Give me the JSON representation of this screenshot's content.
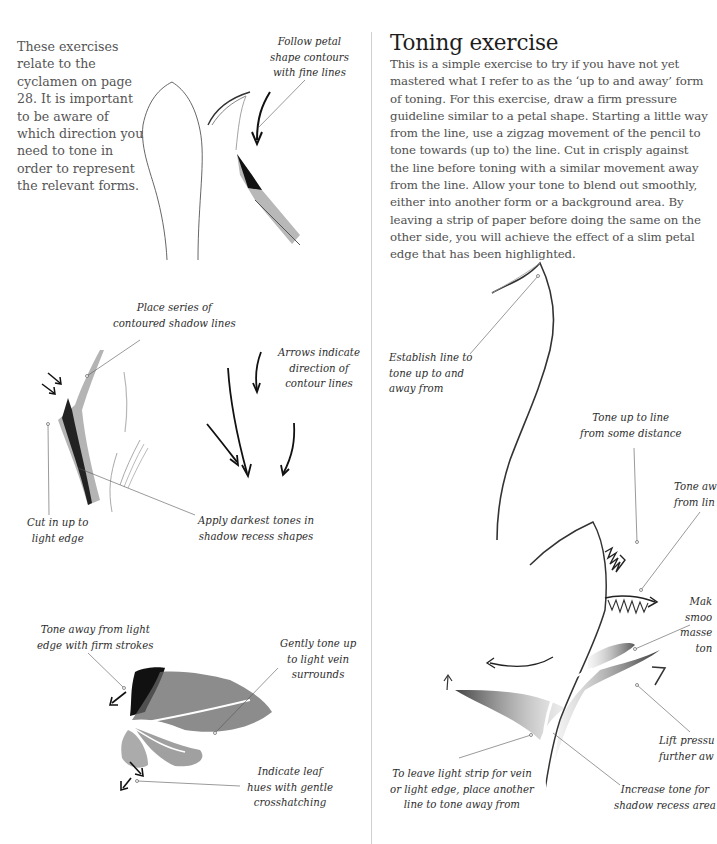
{
  "left_page": {
    "intro_text": "These exercises relate to the cyclamen on page 28. It is important to be aware of which direction you need to tone in order to represent the relevant forms.",
    "annotations": {
      "follow_petal": "Follow petal\nshape contours\nwith fine lines",
      "place_series": "Place series of\ncontoured shadow lines",
      "arrows_indicate": "Arrows indicate\ndirection of\ncontour lines",
      "cut_in": "Cut in up to\nlight edge",
      "apply_darkest": "Apply darkest tones in\nshadow recess shapes",
      "tone_away_light": "Tone away from light\nedge with firm strokes",
      "gently_tone": "Gently tone up\nto light vein\nsurrounds",
      "indicate_leaf": "Indicate leaf\nhues with gentle\ncrosshatching"
    }
  },
  "right_page": {
    "heading": "Toning exercise",
    "body_text": "This is a simple exercise to try if you have not yet mastered what I refer to as the ‘up to and away’ form of toning. For this exercise, draw a firm pressure guideline similar to a petal shape. Starting a little way from the line, use a zigzag movement of the pencil to tone towards (up to) the line. Cut in crisply against the line before toning with a similar movement away from the line. Allow your tone to blend out smoothly, either into another form or a background area. By leaving a strip of paper before doing the same on the other side, you will achieve the effect of a slim petal edge that has been highlighted.",
    "annotations": {
      "establish_line": "Establish line to\ntone up to and\naway from",
      "tone_up_to_line": "Tone up to line\nfrom some distance",
      "tone_away_from_line": "Tone aw\nfrom lin",
      "make_smooth": "Mak\nsmoo\nmasse\nton",
      "lift_pressure": "Lift pressu\nfurther aw",
      "leave_light_strip": "To leave light strip for vein\nor light edge, place another\nline to tone away from",
      "increase_tone": "Increase tone for\nshadow recess area"
    }
  }
}
